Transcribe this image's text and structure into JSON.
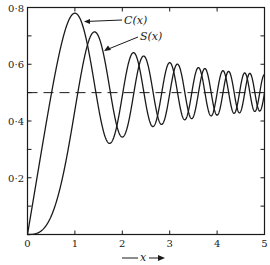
{
  "chart_data": {
    "type": "line",
    "title": "",
    "xlabel": "x",
    "ylabel": "",
    "xlim": [
      0,
      5
    ],
    "ylim": [
      0,
      0.8
    ],
    "xticks": [
      0,
      1,
      2,
      3,
      4,
      5
    ],
    "xtick_labels": [
      "0",
      "1",
      "2",
      "3",
      "4",
      "5"
    ],
    "yticks": [
      0.2,
      0.4,
      0.6,
      0.8
    ],
    "ytick_labels": [
      "0·2",
      "0·4",
      "0·6",
      "0·8"
    ],
    "reference_line": {
      "y": 0.5,
      "style": "dashed"
    },
    "grid": false,
    "series": [
      {
        "name": "C(x)",
        "label": "C(x)",
        "x": [
          0,
          0.25,
          0.5,
          0.75,
          1.0,
          1.25,
          1.5,
          1.75,
          2.0,
          2.25,
          2.5,
          2.75,
          3.0,
          3.25,
          3.5,
          3.75,
          4.0,
          4.25,
          4.5,
          4.75,
          5.0
        ],
        "values": [
          0,
          0.2498,
          0.4923,
          0.6935,
          0.7799,
          0.6975,
          0.4453,
          0.3219,
          0.4883,
          0.5946,
          0.4574,
          0.4709,
          0.6058,
          0.4227,
          0.5326,
          0.4805,
          0.4984,
          0.4678,
          0.5261,
          0.4831,
          0.5637
        ]
      },
      {
        "name": "S(x)",
        "label": "S(x)",
        "x": [
          0,
          0.25,
          0.5,
          0.75,
          1.0,
          1.25,
          1.5,
          1.75,
          2.0,
          2.25,
          2.5,
          2.75,
          3.0,
          3.25,
          3.5,
          3.75,
          4.0,
          4.25,
          4.5,
          4.75,
          5.0
        ],
        "values": [
          0,
          0.0082,
          0.0647,
          0.2089,
          0.4383,
          0.6713,
          0.6975,
          0.4994,
          0.3434,
          0.53,
          0.6192,
          0.3907,
          0.4963,
          0.5638,
          0.4152,
          0.4911,
          0.4205,
          0.5417,
          0.4342,
          0.4574,
          0.4992
        ]
      }
    ]
  },
  "labels": {
    "c_label": "C(x)",
    "s_label": "S(x)",
    "x_axis_label": "x"
  }
}
